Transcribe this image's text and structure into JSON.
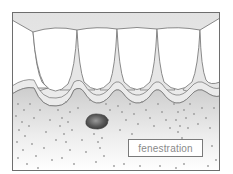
{
  "figure": {
    "label": "fenestration",
    "colors": {
      "frame": "#6e6e6e",
      "gingiva_band": "#ececec",
      "tooth": "#ffffff",
      "bone_top": "#cfcfcf",
      "bone_bottom": "#ffffff",
      "dots": "#9a9a9a",
      "defect": "#555555",
      "label_text": "#8a8a8a"
    }
  }
}
